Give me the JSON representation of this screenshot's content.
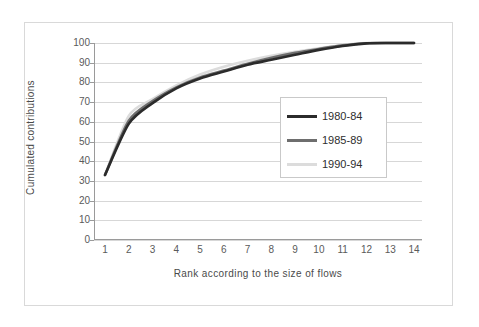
{
  "chart_data": {
    "type": "line",
    "title": "",
    "xlabel": "Rank according to the size of flows",
    "ylabel": "Cumulated contributions",
    "xlim": [
      1,
      14
    ],
    "ylim": [
      0,
      100
    ],
    "grid": true,
    "legend_position": "center-right",
    "x": [
      1,
      2,
      3,
      4,
      5,
      6,
      7,
      8,
      9,
      10,
      11,
      12,
      13,
      14
    ],
    "xticklabels": [
      "1",
      "2",
      "3",
      "4",
      "5",
      "6",
      "7",
      "8",
      "9",
      "10",
      "11",
      "12",
      "13",
      "14"
    ],
    "yticklabels": [
      "0",
      "10",
      "20",
      "30",
      "40",
      "50",
      "60",
      "70",
      "80",
      "90",
      "100"
    ],
    "yticks": [
      0,
      10,
      20,
      30,
      40,
      50,
      60,
      70,
      80,
      90,
      100
    ],
    "series": [
      {
        "name": "1980-84",
        "color": "#2b2b2b",
        "values": [
          33,
          59,
          69.5,
          77,
          82,
          85.5,
          89,
          91.5,
          94,
          96.5,
          98.5,
          99.8,
          100,
          100
        ]
      },
      {
        "name": "1985-89",
        "color": "#6e6e6e",
        "values": [
          33,
          60.5,
          70.5,
          77.5,
          82.5,
          86,
          89.5,
          92.5,
          95,
          97,
          98.8,
          99.9,
          100,
          100
        ]
      },
      {
        "name": "1990-94",
        "color": "#dcdcdc",
        "values": [
          33,
          63,
          71.5,
          78.5,
          84,
          88,
          91,
          93.5,
          95.5,
          97.3,
          99,
          100,
          100,
          100
        ]
      }
    ]
  },
  "legend": {
    "entries": [
      {
        "label": "1980-84",
        "color": "#2b2b2b"
      },
      {
        "label": "1985-89",
        "color": "#6e6e6e"
      },
      {
        "label": "1990-94",
        "color": "#dcdcdc"
      }
    ]
  },
  "axes": {
    "x_title": "Rank according to the size of flows",
    "y_title": "Cumulated contributions"
  }
}
